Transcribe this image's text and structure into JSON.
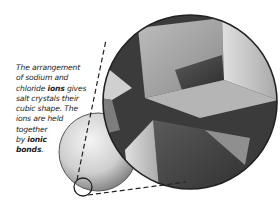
{
  "caption": {
    "line1": "The arrangement",
    "line2": "of sodium and",
    "line3a": "chloride ",
    "line3b": "ions",
    "line3c": " gives",
    "line4": "salt crystals their",
    "line5": "cubic shape. The",
    "line6": "ions are held",
    "line7": "together",
    "line8a": "by ",
    "line8b": "ionic",
    "line9a": "bonds",
    "line9b": "."
  },
  "illustration": {
    "subject": "salt crystal magnified view",
    "colors": {
      "crystal_dark": "#3a3a3a",
      "crystal_light": "#d8d8d8",
      "outline": "#222222"
    }
  }
}
